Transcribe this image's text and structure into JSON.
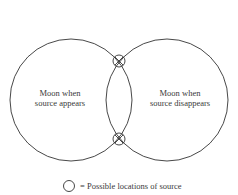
{
  "diagram": {
    "type": "venn-two-circles",
    "left_circle": {
      "label_line1": "Moon when",
      "label_line2": "source appears"
    },
    "right_circle": {
      "label_line1": "Moon when",
      "label_line2": "source disappears"
    },
    "intersection_markers": [
      {
        "name": "top-intersection",
        "symbol": "circle-with-x"
      },
      {
        "name": "bottom-intersection",
        "symbol": "circle-with-x"
      }
    ],
    "legend": {
      "symbol": "circle",
      "text": "= Possible locations of source"
    },
    "colors": {
      "stroke": "#333333",
      "text": "#3a3a3a",
      "background": "#ffffff"
    }
  }
}
